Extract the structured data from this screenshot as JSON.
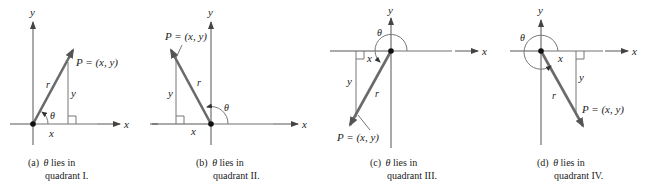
{
  "figure": {
    "panels": [
      {
        "id": "a",
        "caption_line1": "(a)",
        "caption_theta": "θ",
        "caption_rest": "lies in",
        "caption_line2": "quadrant I.",
        "point_label": "P = (x, y)",
        "x_label": "x",
        "y_label": "y",
        "r_label": "r",
        "theta_label": "θ",
        "axis_x_label": "x",
        "axis_y_label": "y"
      },
      {
        "id": "b",
        "caption_line1": "(b)",
        "caption_theta": "θ",
        "caption_rest": "lies in",
        "caption_line2": "quadrant II.",
        "point_label": "P = (x, y)",
        "x_label": "x",
        "y_label": "y",
        "r_label": "r",
        "theta_label": "θ",
        "axis_x_label": "x",
        "axis_y_label": "y"
      },
      {
        "id": "c",
        "caption_line1": "(c)",
        "caption_theta": "θ",
        "caption_rest": "lies in",
        "caption_line2": "quadrant III.",
        "point_label": "P = (x, y)",
        "x_label": "x",
        "y_label": "y",
        "r_label": "r",
        "theta_label": "θ",
        "axis_x_label": "x",
        "axis_y_label": "y"
      },
      {
        "id": "d",
        "caption_line1": "(d)",
        "caption_theta": "θ",
        "caption_rest": "lies in",
        "caption_line2": "quadrant IV.",
        "point_label": "P = (x, y)",
        "x_label": "x",
        "y_label": "y",
        "r_label": "r",
        "theta_label": "θ",
        "axis_x_label": "x",
        "axis_y_label": "y"
      }
    ]
  },
  "colors": {
    "vector": "#6a6a6a",
    "axis": "#555555",
    "initial_side": "#b8b8b8",
    "text": "#222222"
  }
}
